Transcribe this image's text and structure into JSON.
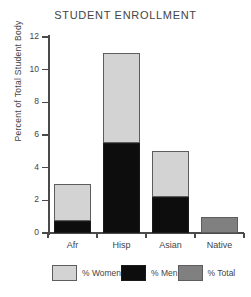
{
  "chart_data": {
    "type": "bar",
    "title": "STUDENT ENROLLMENT",
    "xlabel": "",
    "ylabel": "Percent of Total Student Body",
    "categories": [
      "Afr",
      "Hisp",
      "Asian",
      "Native"
    ],
    "ylim": [
      0,
      12
    ],
    "yticks": [
      0,
      2,
      4,
      6,
      8,
      10,
      12
    ],
    "ytick_labels": [
      "0",
      "2",
      "4",
      "6",
      "8",
      "10",
      "12"
    ],
    "grid": false,
    "stacked": true,
    "legend_position": "bottom",
    "series": [
      {
        "name": "% Women",
        "color": "#d3d3d3",
        "values": [
          2.25,
          5.5,
          2.8,
          0
        ]
      },
      {
        "name": "% Men",
        "color": "#0d0d0d",
        "values": [
          0.75,
          5.5,
          2.2,
          0
        ]
      },
      {
        "name": "% Total",
        "color": "#808080",
        "values": [
          0,
          0,
          0,
          1.0
        ]
      }
    ],
    "totals": [
      3.0,
      11.0,
      5.0,
      1.0
    ]
  },
  "legend": {
    "items": [
      {
        "label": "% Women",
        "color": "#d3d3d3"
      },
      {
        "label": "% Men",
        "color": "#0d0d0d"
      },
      {
        "label": "% Total",
        "color": "#808080"
      }
    ]
  }
}
